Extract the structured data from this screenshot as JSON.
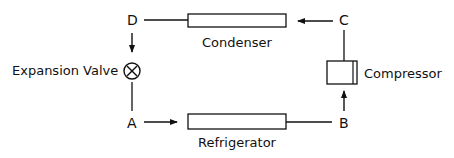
{
  "diagram": {
    "type": "refrigeration-cycle",
    "points": {
      "a": "A",
      "b": "B",
      "c": "C",
      "d": "D"
    },
    "components": {
      "condenser": "Condenser",
      "compressor": "Compressor",
      "refrigerator": "Refrigerator",
      "expansion_valve": "Expansion Valve"
    },
    "flows": [
      {
        "from": "A",
        "to": "Refrigerator",
        "arrow": true
      },
      {
        "from": "Refrigerator",
        "to": "B",
        "arrow": false
      },
      {
        "from": "B",
        "to": "Compressor",
        "arrow": true
      },
      {
        "from": "Compressor",
        "to": "C",
        "arrow": false
      },
      {
        "from": "C",
        "to": "Condenser",
        "arrow": true
      },
      {
        "from": "Condenser",
        "to": "D",
        "arrow": false
      },
      {
        "from": "D",
        "to": "Expansion Valve",
        "arrow": true
      },
      {
        "from": "Expansion Valve",
        "to": "A",
        "arrow": false
      }
    ],
    "stroke_color": "#111111"
  }
}
